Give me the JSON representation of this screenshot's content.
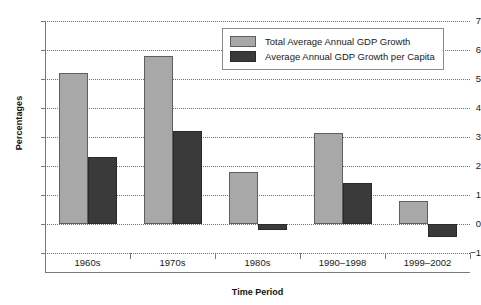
{
  "chart_data": {
    "type": "bar",
    "title": "",
    "xlabel": "Time Period",
    "ylabel": "Percentages",
    "categories": [
      "1960s",
      "1970s",
      "1980s",
      "1990–1998",
      "1999–2002"
    ],
    "series": [
      {
        "name": "Total Average Annual GDP Growth",
        "color": "#a8a8a8",
        "values": [
          5.2,
          5.8,
          1.8,
          3.15,
          0.8
        ]
      },
      {
        "name": "Average Annual GDP Growth per Capita",
        "color": "#3a3a3a",
        "values": [
          2.3,
          3.2,
          -0.2,
          1.4,
          -0.45
        ]
      }
    ],
    "ylim": [
      -1,
      7
    ],
    "yticks": [
      7,
      6,
      5,
      4,
      3,
      2,
      1,
      0,
      -1
    ],
    "ytick_labels": [
      "7",
      "6",
      "5",
      "4",
      "3",
      "2",
      "1",
      "0",
      "−1"
    ],
    "grid": true,
    "grid_style": "dotted-horizontal",
    "legend_position": "top-right-inside"
  },
  "axes": {
    "y_title": "Percentages",
    "x_title": "Time Period"
  },
  "legend": {
    "entries": [
      {
        "label": "Total Average Annual GDP Growth",
        "swatch": "total"
      },
      {
        "label": "Average Annual GDP Growth per Capita",
        "swatch": "capita"
      }
    ]
  }
}
